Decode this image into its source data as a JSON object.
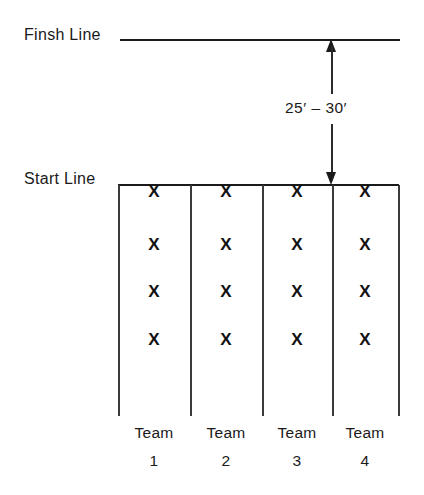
{
  "diagram": {
    "type": "sports-formation-diagram",
    "ink_color": "#1a1a1a",
    "background_color": "#ffffff",
    "finish_line_label": "Finsh Line",
    "start_line_label": "Start Line",
    "distance_label": "25′ – 30′",
    "distance": {
      "min": 25,
      "max": 30,
      "unit": "feet",
      "unit_symbol": "′"
    },
    "lanes_count": 4,
    "players_per_lane": 4,
    "player_marker": "X",
    "lanes": [
      {
        "team_name": "Team",
        "team_number": "1",
        "center_x": 154,
        "markers": [
          "X",
          "X",
          "X",
          "X"
        ]
      },
      {
        "team_name": "Team",
        "team_number": "2",
        "center_x": 226,
        "markers": [
          "X",
          "X",
          "X",
          "X"
        ]
      },
      {
        "team_name": "Team",
        "team_number": "3",
        "center_x": 297,
        "markers": [
          "X",
          "X",
          "X",
          "X"
        ]
      },
      {
        "team_name": "Team",
        "team_number": "4",
        "center_x": 365,
        "markers": [
          "X",
          "X",
          "X",
          "X"
        ]
      }
    ],
    "marker_rows_y": [
      192,
      245,
      292,
      340
    ],
    "lane_divider_x": [
      118,
      190,
      262,
      332,
      398
    ]
  }
}
